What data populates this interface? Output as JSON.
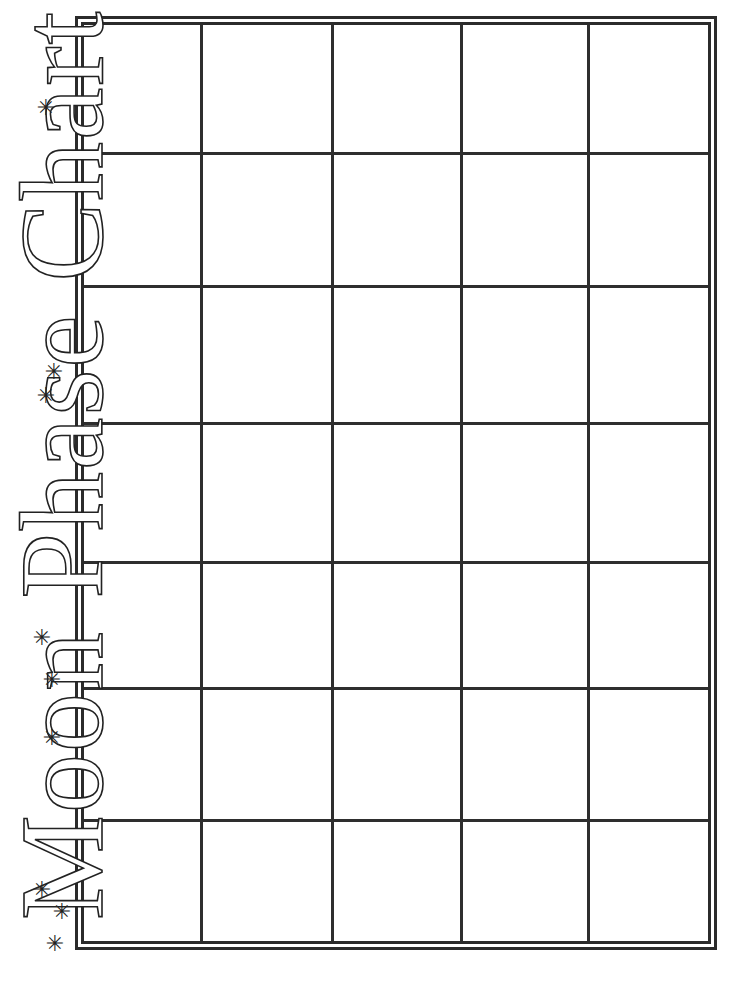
{
  "document": {
    "title": "Moon Phase Chart",
    "title_orientation": "vertical, reading bottom-to-top along left edge"
  },
  "decorations": {
    "star_glyph": "✳",
    "stars": [
      {
        "x": 42,
        "y": 890
      },
      {
        "x": 62,
        "y": 912
      },
      {
        "x": 55,
        "y": 944
      },
      {
        "x": 42,
        "y": 638
      },
      {
        "x": 52,
        "y": 680
      },
      {
        "x": 52,
        "y": 738
      },
      {
        "x": 54,
        "y": 372
      },
      {
        "x": 46,
        "y": 396
      },
      {
        "x": 46,
        "y": 108
      }
    ]
  },
  "chart": {
    "columns": 5,
    "rows": 7,
    "cells_filled": 0,
    "colors": {
      "line": "#2e2e2e",
      "background": "#ffffff"
    }
  }
}
